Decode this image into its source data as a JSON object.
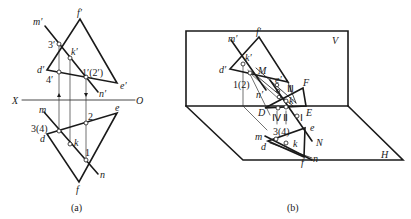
{
  "figure_a": {
    "caption": "(a)",
    "axis": {
      "left": "X",
      "right": "O"
    },
    "labels": {
      "m_prime": "m′",
      "f_prime": "f′",
      "k_prime": "k′",
      "d_prime": "d′",
      "e_prime": "e′",
      "n_prime": "n′",
      "p3_prime": "3′",
      "p4_prime": "4′",
      "p12_prime": "1′(2′)",
      "m": "m",
      "d": "d",
      "k": "k",
      "e": "e",
      "n": "n",
      "f": "f",
      "p34": "3(4)",
      "p2": "2",
      "p1": "1"
    }
  },
  "figure_b": {
    "caption": "(b)",
    "planes": {
      "V": "V",
      "H": "H"
    },
    "labels": {
      "m_prime": "m′",
      "f_prime": "f′",
      "k_prime": "k′",
      "d_prime": "d′",
      "M": "M",
      "e_prime": "e′",
      "p12": "1(2)",
      "n_prime": "n′",
      "III": "Ⅲ",
      "F": "F",
      "K": "k",
      "D": "D",
      "E": "E",
      "IV": "Ⅳ",
      "II": "Ⅱ",
      "I": "Ⅰ",
      "p34": "3(4)",
      "e": "e",
      "N": "N",
      "m": "m",
      "d": "d",
      "k": "k",
      "n": "n",
      "f": "f"
    }
  }
}
